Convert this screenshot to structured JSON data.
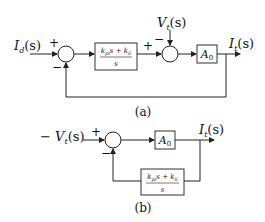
{
  "diagram_a": {
    "input_label": "I",
    "input_sub": "d",
    "input_arg": "(s)",
    "sum1_plus": "+",
    "sum1_minus": "−",
    "controller_num_a": "k",
    "controller_num_a_sub": "pi",
    "controller_num_mid": "s + k",
    "controller_num_b_sub": "ii",
    "controller_den": "s",
    "sum2_plus": "+",
    "sum2_minus": "−",
    "disturbance_label": "V",
    "disturbance_sub": "t",
    "disturbance_arg": "(s)",
    "plant_label": "A",
    "plant_sub": "0",
    "output_label": "I",
    "output_sub": "t",
    "output_arg": "(s)",
    "caption": "(a)"
  },
  "diagram_b": {
    "input_prefix": "− ",
    "input_label": "V",
    "input_sub": "t",
    "input_arg": "(s)",
    "sum_plus": "+",
    "sum_minus": "−",
    "plant_label": "A",
    "plant_sub": "0",
    "output_label": "I",
    "output_sub": "t",
    "output_arg": "(s)",
    "feedback_num_a": "k",
    "feedback_num_a_sub": "pi",
    "feedback_num_mid": "s + k",
    "feedback_num_b_sub": "ii",
    "feedback_den": "s",
    "caption": "(b)"
  }
}
